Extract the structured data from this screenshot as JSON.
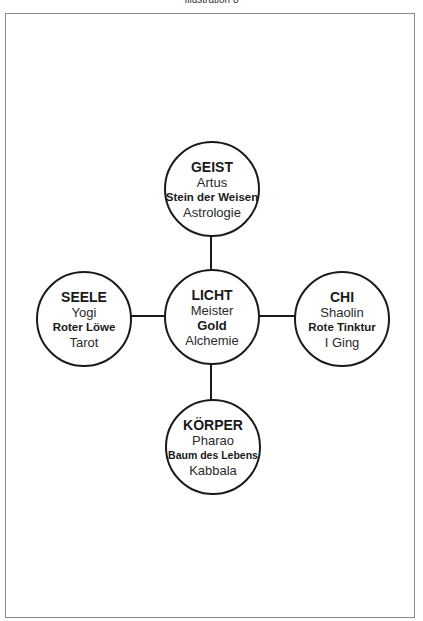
{
  "page": {
    "title": "Illustration 8"
  },
  "diagram": {
    "nodes": {
      "top": {
        "title": "GEIST",
        "line1": "Artus",
        "line2": "Stein der Weisen",
        "line3": "Astrologie"
      },
      "center": {
        "title": "LICHT",
        "line1": "Meister",
        "line2": "Gold",
        "line3": "Alchemie"
      },
      "left": {
        "title": "SEELE",
        "line1": "Yogi",
        "line2": "Roter Löwe",
        "line3": "Tarot"
      },
      "right": {
        "title": "CHI",
        "line1": "Shaolin",
        "line2": "Rote Tinktur",
        "line3": "I Ging"
      },
      "bottom": {
        "title": "KÖRPER",
        "line1": "Pharao",
        "line2": "Baum des Lebens",
        "line3": "Kabbala"
      }
    },
    "edges": [
      {
        "from": "center",
        "to": "top"
      },
      {
        "from": "center",
        "to": "left"
      },
      {
        "from": "center",
        "to": "right"
      },
      {
        "from": "center",
        "to": "bottom"
      }
    ],
    "colors": {
      "stroke": "#1a1a1a",
      "frame": "#8a8a8a",
      "background": "#ffffff"
    }
  }
}
